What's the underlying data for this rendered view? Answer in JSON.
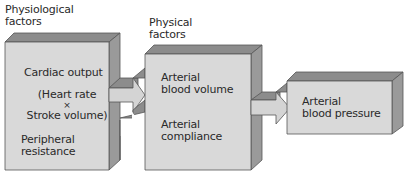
{
  "diagram": {
    "type": "flow",
    "colors": {
      "front_face": "#d9d9d9",
      "top_face": "#8c8c8c",
      "side_face": "#9a9a9a",
      "edge": "#555555",
      "arrow_fill": "#d4d4d4"
    },
    "headers": {
      "physiological": "Physiological\nfactors",
      "physiological_line1": "Physiological",
      "physiological_line2": "factors",
      "physical_line1": "Physical",
      "physical_line2": "factors"
    },
    "boxes": [
      {
        "id": "physiological-box",
        "items": [
          {
            "text": "Cardiac output"
          },
          {
            "line1": "(Heart rate",
            "line2": "×",
            "line3": "Stroke volume)"
          },
          {
            "line1": "Peripheral",
            "line2": "resistance"
          }
        ]
      },
      {
        "id": "physical-box",
        "items": [
          {
            "line1": "Arterial",
            "line2": "blood volume"
          },
          {
            "line1": "Arterial",
            "line2": "compliance"
          }
        ]
      },
      {
        "id": "outcome-box",
        "items": [
          {
            "line1": "Arterial",
            "line2": "blood pressure"
          }
        ]
      }
    ],
    "edges": [
      {
        "from": "physiological-box",
        "to": "physical-box",
        "count": 2
      },
      {
        "from": "physical-box",
        "to": "outcome-box",
        "count": 1
      }
    ]
  }
}
